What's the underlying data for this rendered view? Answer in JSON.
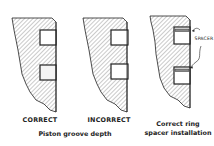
{
  "figures": [
    {
      "id": "correct-groove",
      "label": "CORRECT"
    },
    {
      "id": "incorrect-groove",
      "label": "INCORRECT"
    },
    {
      "id": "spacer-installation",
      "label_line1": "Correct ring",
      "label_line2": "spacer installation",
      "callout": "SPACER"
    }
  ],
  "captions": {
    "groove_depth": "Piston groove depth"
  },
  "colors": {
    "line": "#222222",
    "hatch": "#555555",
    "background": "#ffffff"
  }
}
